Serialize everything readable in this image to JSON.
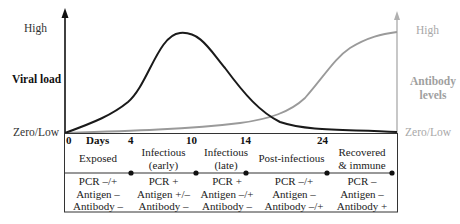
{
  "left_axis": {
    "title": "Viral load",
    "high_label": "High",
    "low_label": "Zero/Low"
  },
  "right_axis": {
    "title_line1": "Antibody",
    "title_line2": "levels",
    "high_label": "High",
    "low_label": "Zero/Low"
  },
  "x_axis": {
    "unit_label": "Days",
    "ticks": [
      "0",
      "4",
      "10",
      "14",
      "24"
    ]
  },
  "stages": [
    {
      "line1": "Exposed",
      "line2": "",
      "pcr": "PCR –/+",
      "antigen": "Antigen –",
      "antibody": "Antibody –"
    },
    {
      "line1": "Infectious",
      "line2": "(early)",
      "pcr": "PCR +",
      "antigen": "Antigen +/–",
      "antibody": "Antibody –"
    },
    {
      "line1": "Infectious",
      "line2": "(late)",
      "pcr": "PCR +",
      "antigen": "Antigen –/+",
      "antibody": "Antibody –"
    },
    {
      "line1": "Post-infectious",
      "line2": "",
      "pcr": "PCR –/+",
      "antigen": "Antigen –",
      "antibody": "Antibody –/+"
    },
    {
      "line1": "Recovered",
      "line2": "& immune",
      "pcr": "PCR –",
      "antigen": "Antigen –",
      "antibody": "Antibody +"
    }
  ],
  "colors": {
    "viral_curve": "#1a1a1a",
    "antibody_curve": "#9a9a9a",
    "right_axis": "#b0b0b0"
  }
}
